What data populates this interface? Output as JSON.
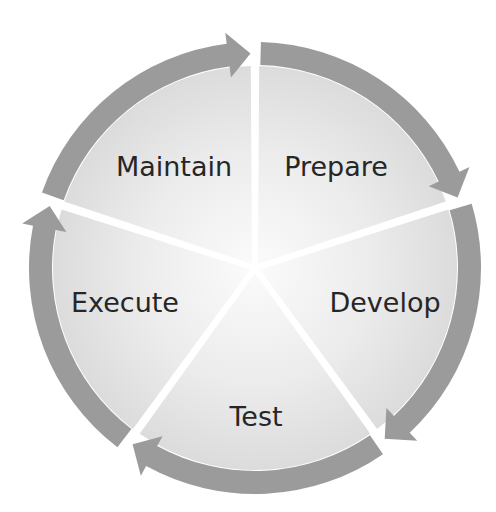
{
  "diagram": {
    "type": "cycle",
    "center": [
      255,
      268
    ],
    "outer_radius": 226,
    "band_width": 23,
    "colors": {
      "arrow_band": "#9b9b9b",
      "wedge_outer": "#dcdcdc",
      "wedge_inner": "#f7f7f7",
      "text": "#262626",
      "gap": "#ffffff"
    },
    "stages": [
      {
        "id": "prepare",
        "label": "Prepare",
        "start_deg": 0,
        "end_deg": 72,
        "label_pos": [
          336,
          176
        ]
      },
      {
        "id": "develop",
        "label": "Develop",
        "start_deg": 72,
        "end_deg": 144,
        "label_pos": [
          385,
          312
        ]
      },
      {
        "id": "test",
        "label": "Test",
        "start_deg": 144,
        "end_deg": 216,
        "label_pos": [
          256,
          426
        ]
      },
      {
        "id": "execute",
        "label": "Execute",
        "start_deg": 216,
        "end_deg": 288,
        "label_pos": [
          125,
          312
        ]
      },
      {
        "id": "maintain",
        "label": "Maintain",
        "start_deg": 288,
        "end_deg": 360,
        "label_pos": [
          174,
          176
        ]
      }
    ]
  }
}
